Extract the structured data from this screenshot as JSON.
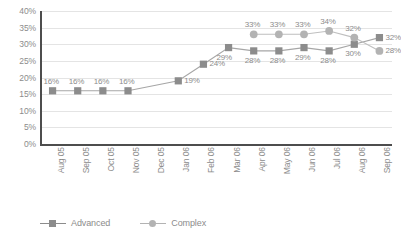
{
  "chart_data": {
    "type": "line",
    "title": "",
    "xlabel": "",
    "ylabel": "",
    "ylim": [
      0,
      40
    ],
    "ytick_step": 5,
    "grid": true,
    "legend_position": "bottom",
    "categories": [
      "Aug 05",
      "Sep 05",
      "Oct 05",
      "Nov 05",
      "Dec 05",
      "Jan 06",
      "Feb 06",
      "Mar 06",
      "Apr 06",
      "May 06",
      "Jun 06",
      "Jul 06",
      "Aug 06",
      "Sep 06"
    ],
    "ytick_labels": [
      "40%",
      "35%",
      "30%",
      "25%",
      "20%",
      "15%",
      "10%",
      "5%",
      "0%"
    ],
    "ytick_values": [
      40,
      35,
      30,
      25,
      20,
      15,
      10,
      5,
      0
    ],
    "series": [
      {
        "name": "Advanced",
        "marker": "square",
        "color": "#8c8c8c",
        "line_color": "#a6a6a6",
        "values": [
          16,
          16,
          16,
          16,
          null,
          19,
          24,
          29,
          28,
          28,
          29,
          28,
          30,
          32
        ],
        "labels": [
          "16%",
          "16%",
          "16%",
          "16%",
          "",
          "19%",
          "24%",
          "29%",
          "28%",
          "28%",
          "29%",
          "28%",
          "30%",
          "32%"
        ]
      },
      {
        "name": "Complex",
        "marker": "circle",
        "color": "#b3b3b3",
        "line_color": "#bfbfbf",
        "values": [
          null,
          null,
          null,
          null,
          null,
          null,
          null,
          null,
          33,
          33,
          33,
          34,
          32,
          28
        ],
        "labels": [
          "",
          "",
          "",
          "",
          "",
          "",
          "",
          "",
          "33%",
          "33%",
          "33%",
          "34%",
          "32%",
          "28%"
        ]
      }
    ]
  },
  "legend": {
    "items": [
      {
        "label": "Advanced",
        "marker": "square",
        "color": "#8c8c8c"
      },
      {
        "label": "Complex",
        "marker": "circle",
        "color": "#b3b3b3"
      }
    ]
  },
  "colors": {
    "advanced": "#8c8c8c",
    "complex": "#b3b3b3",
    "grid": "#e4e4e4",
    "axis": "#4d4d4d",
    "text": "#8c8c8c",
    "background": "#ffffff"
  }
}
